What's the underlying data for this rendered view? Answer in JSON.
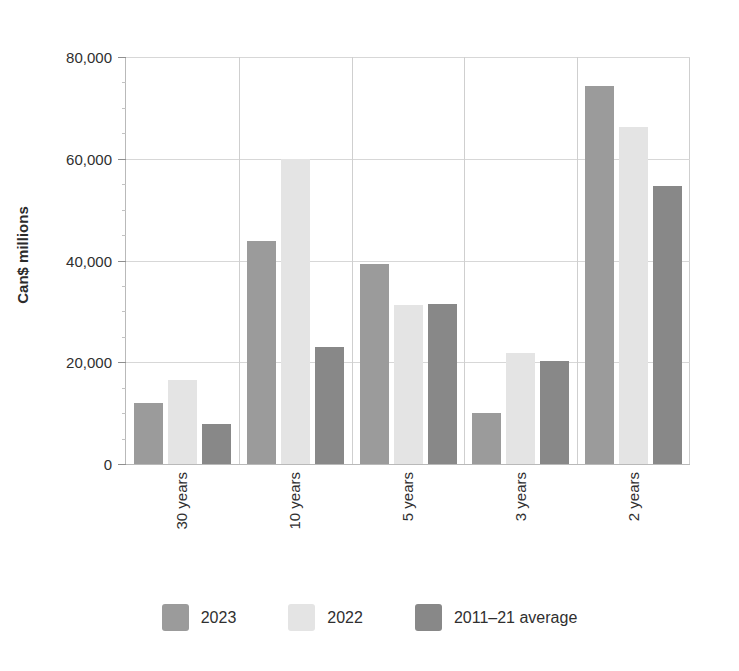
{
  "chart_data": {
    "type": "bar",
    "title": "",
    "subtitle": "",
    "xlabel": "",
    "ylabel": "Can$ millions",
    "categories": [
      "30 years",
      "10 years",
      "5 years",
      "3 years",
      "2 years"
    ],
    "series": [
      {
        "name": "2023",
        "color": "#9b9b9b",
        "values": [
          11900,
          43800,
          39400,
          10100,
          74300
        ]
      },
      {
        "name": "2022",
        "color": "#e4e4e4",
        "values": [
          16600,
          60000,
          31300,
          21800,
          66200
        ]
      },
      {
        "name": "2011–21 average",
        "color": "#888888",
        "values": [
          7900,
          23000,
          31500,
          20200,
          54700
        ]
      }
    ],
    "ylim": [
      0,
      80000
    ],
    "ytick_values": [
      0,
      20000,
      40000,
      60000,
      80000
    ],
    "ytick_labels": [
      "0",
      "20,000",
      "40,000",
      "60,000",
      "80,000"
    ],
    "yminor_step": 5000,
    "grid": "horizontal",
    "legend_position": "bottom",
    "group_separators": true,
    "background": "#ffffff"
  },
  "legend": {
    "items": [
      {
        "label": "2023",
        "color": "#9b9b9b"
      },
      {
        "label": "2022",
        "color": "#e4e4e4"
      },
      {
        "label": "2011–21 average",
        "color": "#888888"
      }
    ]
  }
}
